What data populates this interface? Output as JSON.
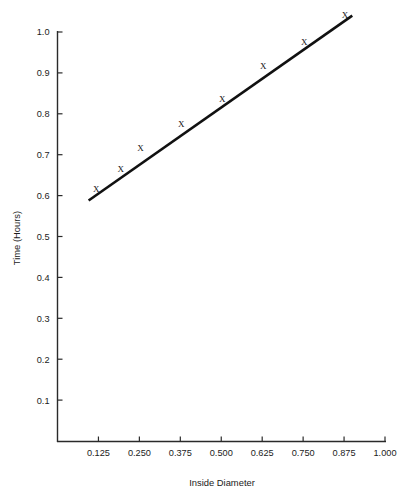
{
  "chart_data": {
    "type": "line",
    "title": "",
    "xlabel": "Inside Diameter",
    "ylabel": "Time (Hours)",
    "xlim": [
      0.0,
      1.0625
    ],
    "ylim": [
      0.0,
      1.05
    ],
    "grid": false,
    "legend": null,
    "marker": "x",
    "line_color": "#111111",
    "xticks": [
      0.125,
      0.25,
      0.375,
      0.5,
      0.625,
      0.75,
      0.875,
      1.0
    ],
    "xticklabels": [
      "0.125",
      "0.250",
      "0.375",
      "0.500",
      "0.625",
      "0.750",
      "0.875",
      "1.000"
    ],
    "yticks": [
      0.1,
      0.2,
      0.3,
      0.4,
      0.5,
      0.6,
      0.7,
      0.8,
      0.9,
      1.0
    ],
    "yticklabels": [
      "0.1",
      "0.2",
      "0.3",
      "0.4",
      "0.5",
      "0.6",
      "0.7",
      "0.8",
      "0.9",
      "1.0"
    ],
    "series": [
      {
        "name": "Time vs Inside Diameter",
        "x": [
          0.115,
          0.19,
          0.25,
          0.375,
          0.5,
          0.625,
          0.75,
          0.875
        ],
        "y": [
          0.6,
          0.65,
          0.7,
          0.76,
          0.82,
          0.9,
          0.96,
          1.025
        ]
      }
    ],
    "line_extent": {
      "x_start": 0.095,
      "y_start": 0.588,
      "x_end": 0.9,
      "y_end": 1.04
    }
  },
  "axes": {
    "x_axis_label": "Inside Diameter",
    "y_axis_label": "Time (Hours)"
  }
}
